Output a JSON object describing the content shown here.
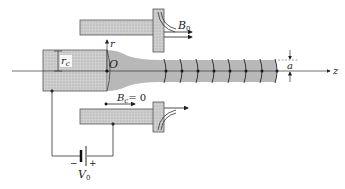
{
  "figure": {
    "labels": {
      "r_axis": "r",
      "origin": "O",
      "cathode_radius": "r",
      "cathode_radius_sub": "c",
      "field_top": "B",
      "field_top_sub": "0",
      "field_bottom": "B",
      "field_bottom_sub": "c",
      "field_bottom_eq": "= 0",
      "beam_radius": "a",
      "z_axis": "z",
      "voltage": "V",
      "voltage_sub": "0",
      "minus": "−",
      "plus": "+"
    },
    "colors": {
      "hatch": "#c8c8c8",
      "beam": "#b4b4b4",
      "line": "#333333",
      "background": "#ffffff"
    },
    "rings_x": [
      165,
      181,
      197,
      213,
      229,
      245,
      261,
      276
    ]
  }
}
